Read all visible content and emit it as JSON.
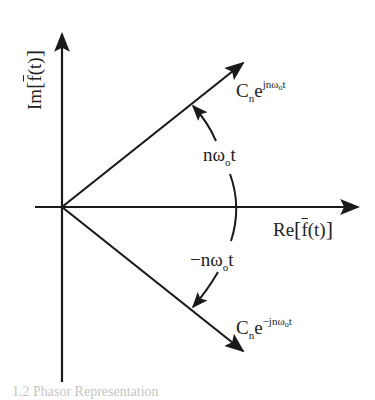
{
  "diagram": {
    "axes": {
      "y_label": {
        "prefix": "Im",
        "open": "[",
        "f": "f",
        "arg": "(t)",
        "close": "]"
      },
      "x_label": {
        "prefix": "Re",
        "open": "[",
        "f": "f",
        "arg": "(t)",
        "close": "]"
      }
    },
    "vectors": [
      {
        "name": "positive-phasor",
        "base": "C",
        "base_sub": "n",
        "exp_base": "e",
        "exp": "jnω",
        "exp_sub": "o",
        "exp_tail": "t"
      },
      {
        "name": "negative-phasor",
        "base": "C",
        "base_sub": "n",
        "exp_base": "e",
        "exp": "−jnω",
        "exp_sub": "o",
        "exp_tail": "t"
      }
    ],
    "angles": [
      {
        "name": "positive-angle",
        "text": "nω",
        "sub": "o",
        "tail": "t"
      },
      {
        "name": "negative-angle",
        "text": "−nω",
        "sub": "o",
        "tail": "t"
      }
    ],
    "colors": {
      "stroke": "#1a1a1a",
      "background": "#ffffff"
    },
    "caption": "1.2  Phasor Representation"
  }
}
